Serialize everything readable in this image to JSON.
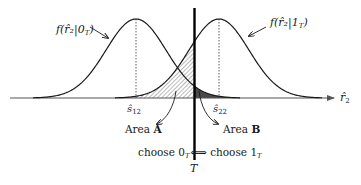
{
  "diagram": {
    "type": "two overlapping gaussian likelihoods with decision threshold",
    "colors": {
      "curve": "#1a1a1a",
      "axis": "#555555",
      "threshold": "#000000",
      "area_a_hatch": "#666666",
      "area_b_fill": "#4a4a4a"
    },
    "labels": {
      "left_curve": "f(r̂₂|0",
      "left_curve_sub": "T",
      "left_curve_close": ")",
      "right_curve": "f(r̂₂|1",
      "right_curve_sub": "T",
      "right_curve_close": ")",
      "s12_base": "ŝ",
      "s12_sub": "12",
      "s22_base": "ŝ",
      "s22_sub": "22",
      "x_axis_base": "r̂",
      "x_axis_sub": "2",
      "area_a_prefix": "Area ",
      "area_a_letter": "A",
      "area_b_prefix": "Area ",
      "area_b_letter": "B",
      "choose0_prefix": "choose 0",
      "choose0_sub": "T",
      "choose0_arrow": "⇐",
      "choose1_arrow": "⇒",
      "choose1_prefix": " choose 1",
      "choose1_sub": "T",
      "threshold": "T"
    }
  }
}
